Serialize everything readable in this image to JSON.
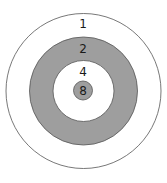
{
  "diagram": {
    "rings": [
      {
        "label": "1",
        "fill": "#ffffff",
        "stroke": "#555555"
      },
      {
        "label": "2",
        "fill": "#9e9e9e",
        "stroke": "#555555"
      },
      {
        "label": "4",
        "fill": "#ffffff",
        "stroke": "#555555"
      },
      {
        "label": "8",
        "fill": "#9e9e9e",
        "stroke": "#555555"
      }
    ]
  }
}
